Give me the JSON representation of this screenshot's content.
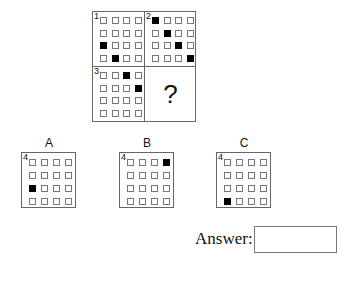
{
  "puzzle": {
    "grid_size": 4,
    "panels": [
      {
        "number": "1",
        "filled": [
          [
            2,
            0
          ],
          [
            3,
            1
          ]
        ]
      },
      {
        "number": "2",
        "filled": [
          [
            0,
            0
          ],
          [
            1,
            1
          ],
          [
            2,
            2
          ],
          [
            3,
            3
          ]
        ]
      },
      {
        "number": "3",
        "filled": [
          [
            0,
            2
          ],
          [
            1,
            3
          ]
        ]
      },
      {
        "number": "",
        "question": "?"
      }
    ]
  },
  "options": [
    {
      "label": "A",
      "number": "4",
      "filled": [
        [
          2,
          0
        ]
      ]
    },
    {
      "label": "B",
      "number": "4",
      "filled": [
        [
          0,
          3
        ]
      ]
    },
    {
      "label": "C",
      "number": "4",
      "filled": [
        [
          3,
          0
        ]
      ]
    }
  ],
  "answer": {
    "label": "Answer:",
    "value": ""
  }
}
